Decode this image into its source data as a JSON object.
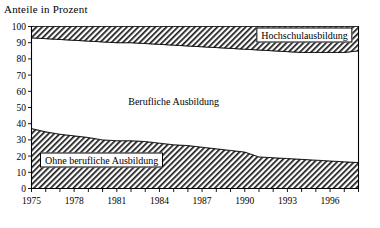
{
  "chart_data": {
    "type": "area",
    "title": "Anteile in Prozent",
    "ylabel": "",
    "xlabel": "",
    "ylim": [
      0,
      100
    ],
    "xlim": [
      1975,
      1998
    ],
    "ytick_step": 10,
    "yticks": [
      "0",
      "10",
      "20",
      "30",
      "40",
      "50",
      "60",
      "70",
      "80",
      "90",
      "100"
    ],
    "xticks_labeled": [
      "1975",
      "1978",
      "1981",
      "1984",
      "1987",
      "1990",
      "1993",
      "1996"
    ],
    "xtick_step_minor": 1,
    "xtick_step_labeled": 3,
    "grid": false,
    "legend_position": "inline-annotations",
    "stacked": true,
    "x": [
      1975,
      1976,
      1977,
      1978,
      1979,
      1980,
      1981,
      1982,
      1983,
      1984,
      1985,
      1986,
      1987,
      1988,
      1989,
      1990,
      1991,
      1992,
      1993,
      1994,
      1995,
      1996,
      1997,
      1998
    ],
    "series": [
      {
        "name": "Ohne berufliche Ausbildung",
        "fill": "hatch",
        "values": [
          37,
          35,
          33.5,
          32.5,
          31.5,
          30,
          29.5,
          29.5,
          29,
          28,
          27,
          26.5,
          25.5,
          24.5,
          23.5,
          22.5,
          19.5,
          19,
          18.5,
          18,
          17.5,
          17,
          16.5,
          16
        ]
      },
      {
        "name": "Berufliche Ausbildung",
        "fill": "white",
        "values": [
          56,
          57.5,
          58.5,
          59,
          59.5,
          60.5,
          60.5,
          60.5,
          60.5,
          61,
          61.5,
          61.5,
          62,
          62.5,
          63,
          63.5,
          66,
          66,
          66,
          66,
          66.5,
          67,
          67.5,
          69
        ]
      },
      {
        "name": "Hochschulausbildung",
        "fill": "hatch",
        "values": [
          7,
          7.5,
          8,
          8.5,
          9,
          9.5,
          10,
          10,
          10.5,
          11,
          11.5,
          12,
          12.5,
          13,
          13.5,
          14,
          14.5,
          15,
          15.5,
          16,
          16,
          16,
          16,
          15
        ]
      }
    ],
    "annotations": [
      {
        "text": "Hochschulausbildung",
        "boxed": true
      },
      {
        "text": "Berufliche Ausbildung",
        "boxed": false
      },
      {
        "text": "Ohne berufliche Ausbildung",
        "boxed": true
      }
    ],
    "colors": {
      "axis": "#000000",
      "hatch": "#000000",
      "middle_fill": "#ffffff",
      "background": "#ffffff"
    }
  }
}
